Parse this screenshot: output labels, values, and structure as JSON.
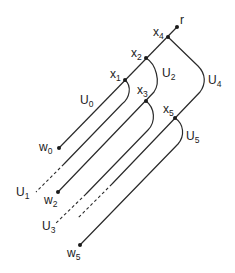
{
  "diagram": {
    "root": {
      "label": "r"
    },
    "vertices": [
      {
        "id": "x4",
        "base": "x",
        "sub": "4"
      },
      {
        "id": "x2",
        "base": "x",
        "sub": "2"
      },
      {
        "id": "x1",
        "base": "x",
        "sub": "1"
      },
      {
        "id": "x3",
        "base": "x",
        "sub": "3"
      },
      {
        "id": "x5",
        "base": "x",
        "sub": "5"
      }
    ],
    "leaves": [
      {
        "id": "w0",
        "base": "w",
        "sub": "0"
      },
      {
        "id": "w2",
        "base": "w",
        "sub": "2"
      },
      {
        "id": "w5",
        "base": "w",
        "sub": "5"
      }
    ],
    "regions": [
      {
        "id": "U0",
        "base": "U",
        "sub": "0"
      },
      {
        "id": "U1",
        "base": "U",
        "sub": "1"
      },
      {
        "id": "U2",
        "base": "U",
        "sub": "2"
      },
      {
        "id": "U3",
        "base": "U",
        "sub": "3"
      },
      {
        "id": "U4",
        "base": "U",
        "sub": "4"
      },
      {
        "id": "U5",
        "base": "U",
        "sub": "5"
      }
    ],
    "colors": {
      "stroke": "#2a2a2a",
      "background": "#ffffff"
    }
  }
}
